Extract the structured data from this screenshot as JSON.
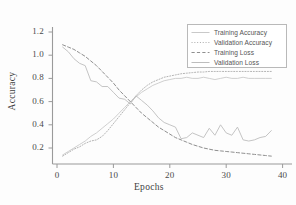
{
  "chart_data": {
    "type": "line",
    "title": "",
    "xlabel": "Epochs",
    "ylabel": "Accuracy",
    "xlim": [
      -2,
      43
    ],
    "ylim": [
      0.06,
      1.28
    ],
    "xticks": [
      "0",
      "10",
      "20",
      "30",
      "40"
    ],
    "xtick_values": [
      0,
      10,
      20,
      30,
      40
    ],
    "yticks": [
      "0.2",
      "0.4",
      "0.6",
      "0.8",
      "1.0",
      "1.2"
    ],
    "ytick_values": [
      0.2,
      0.4,
      0.6,
      0.8,
      1.0,
      1.2
    ],
    "grid": false,
    "legend_position": "upper right",
    "x": [
      1,
      2,
      3,
      4,
      5,
      6,
      7,
      8,
      9,
      10,
      11,
      12,
      13,
      14,
      15,
      16,
      17,
      18,
      19,
      20,
      21,
      22,
      23,
      24,
      25,
      26,
      27,
      28,
      29,
      30,
      31,
      32,
      33,
      34,
      35,
      36,
      37,
      38
    ],
    "series": [
      {
        "name": "Training Accuracy",
        "color": "#c9c9c9",
        "style": "solid",
        "values": [
          0.14,
          0.17,
          0.2,
          0.23,
          0.26,
          0.3,
          0.33,
          0.37,
          0.41,
          0.45,
          0.5,
          0.55,
          0.6,
          0.64,
          0.68,
          0.71,
          0.74,
          0.76,
          0.78,
          0.79,
          0.8,
          0.8,
          0.81,
          0.8,
          0.8,
          0.81,
          0.8,
          0.79,
          0.8,
          0.81,
          0.8,
          0.8,
          0.81,
          0.8,
          0.8,
          0.8,
          0.8,
          0.8
        ]
      },
      {
        "name": "Validation Accuracy",
        "color": "#b3b3b3",
        "style": "dotted",
        "values": [
          0.13,
          0.16,
          0.19,
          0.21,
          0.24,
          0.26,
          0.27,
          0.3,
          0.35,
          0.41,
          0.47,
          0.53,
          0.59,
          0.65,
          0.7,
          0.74,
          0.77,
          0.79,
          0.81,
          0.82,
          0.83,
          0.84,
          0.845,
          0.85,
          0.855,
          0.855,
          0.86,
          0.86,
          0.86,
          0.86,
          0.86,
          0.86,
          0.86,
          0.86,
          0.86,
          0.86,
          0.86,
          0.86
        ]
      },
      {
        "name": "Training Loss",
        "color": "#8f8f8f",
        "style": "dashed",
        "values": [
          1.09,
          1.07,
          1.05,
          1.02,
          0.99,
          0.95,
          0.91,
          0.86,
          0.81,
          0.76,
          0.7,
          0.65,
          0.6,
          0.55,
          0.5,
          0.46,
          0.42,
          0.38,
          0.35,
          0.32,
          0.29,
          0.27,
          0.25,
          0.23,
          0.215,
          0.2,
          0.19,
          0.18,
          0.175,
          0.17,
          0.165,
          0.16,
          0.155,
          0.15,
          0.145,
          0.14,
          0.135,
          0.13
        ]
      },
      {
        "name": "Validation Loss",
        "color": "#bdbdbd",
        "style": "solid",
        "values": [
          1.07,
          1.03,
          0.97,
          0.93,
          0.91,
          0.78,
          0.77,
          0.73,
          0.73,
          0.68,
          0.63,
          0.62,
          0.58,
          0.65,
          0.61,
          0.57,
          0.52,
          0.46,
          0.42,
          0.4,
          0.38,
          0.28,
          0.29,
          0.33,
          0.31,
          0.29,
          0.37,
          0.31,
          0.4,
          0.33,
          0.31,
          0.38,
          0.27,
          0.26,
          0.27,
          0.29,
          0.3,
          0.35
        ]
      }
    ]
  },
  "legend": {
    "entries": [
      {
        "label": "Training Accuracy"
      },
      {
        "label": "Validation Accuracy"
      },
      {
        "label": "Training Loss"
      },
      {
        "label": "Validation Loss"
      }
    ]
  }
}
